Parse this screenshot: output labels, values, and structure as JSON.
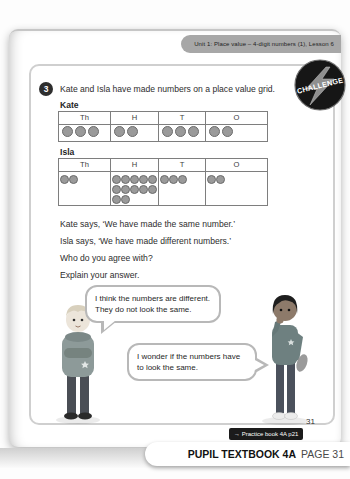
{
  "header": {
    "unit_label": "Unit 1: Place value – 4-digit numbers (1), Lesson 6"
  },
  "challenge": {
    "badge_label": "CHALLENGE",
    "question_number": "3",
    "question_text": "Kate and Isla have made numbers on a place value grid.",
    "place_value_columns": [
      "Th",
      "H",
      "T",
      "O"
    ],
    "kate": {
      "label": "Kate",
      "counters": [
        3,
        2,
        3,
        2
      ]
    },
    "isla": {
      "label": "Isla",
      "counters": [
        2,
        12,
        3,
        2
      ]
    },
    "statements": [
      "Kate says, ‘We have made the same number.’",
      "Isla says, ‘We have made different numbers.’",
      "Who do you agree with?",
      "Explain your answer."
    ],
    "speech_bubbles": [
      "I think the numbers are different. They do not look the same.",
      "I wonder if the numbers have to look the same."
    ]
  },
  "footer": {
    "page_number": "31",
    "practice_link": "→ Practice book 4A p21",
    "book_label": "PUPIL TEXTBOOK 4A",
    "page_label": "PAGE 31"
  },
  "colors": {
    "tab_bg": "#a7a7a7",
    "badge_bg": "#161616",
    "counter_fill": "#9a9a9a",
    "table_border": "#7e7e7e",
    "practice_badge_bg": "#1b1b1b"
  }
}
